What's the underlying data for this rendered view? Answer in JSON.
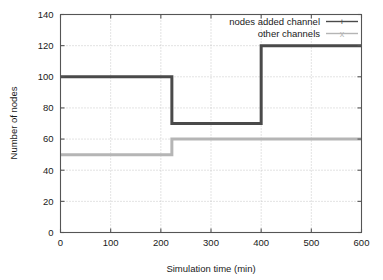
{
  "chart_data": {
    "type": "line",
    "subtype": "step",
    "title": "",
    "xlabel": "Simulation time (min)",
    "ylabel": "Number of nodes",
    "xlim": [
      0,
      600
    ],
    "ylim": [
      0,
      140
    ],
    "xticks": [
      0,
      100,
      200,
      300,
      400,
      500,
      600
    ],
    "yticks": [
      0,
      20,
      40,
      60,
      80,
      100,
      120,
      140
    ],
    "xtick_labels": [
      "0",
      "100",
      "200",
      "300",
      "400",
      "500",
      "600"
    ],
    "ytick_labels": [
      "0",
      "20",
      "40",
      "60",
      "80",
      "100",
      "120",
      "140"
    ],
    "grid": true,
    "grid_style": "dotted",
    "legend_position": "top-right-inside",
    "series": [
      {
        "name": "nodes added channel",
        "color": "#4a4a4a",
        "linewidth": 3,
        "points": [
          [
            0,
            100
          ],
          [
            205,
            100
          ],
          [
            205,
            100
          ],
          [
            222,
            100
          ],
          [
            222,
            70
          ],
          [
            400,
            70
          ],
          [
            400,
            120
          ],
          [
            600,
            120
          ]
        ],
        "step_segments": [
          {
            "x_start": 205,
            "x_end": 222,
            "y": 100
          },
          {
            "x_start": 222,
            "x_end": 400,
            "y": 70
          },
          {
            "x_start": 400,
            "x_end": 600,
            "y": 120
          }
        ]
      },
      {
        "name": "other channels",
        "color": "#b5b5b5",
        "linewidth": 3,
        "points": [
          [
            0,
            50
          ],
          [
            222,
            50
          ],
          [
            222,
            60
          ],
          [
            600,
            60
          ]
        ],
        "step_segments": [
          {
            "x_start": 0,
            "x_end": 222,
            "y": 50
          },
          {
            "x_start": 222,
            "x_end": 600,
            "y": 60
          }
        ]
      }
    ],
    "legend": [
      {
        "label": "nodes added channel",
        "color": "#4a4a4a",
        "marker": "+"
      },
      {
        "label": "other channels",
        "color": "#b5b5b5",
        "marker": "x"
      }
    ]
  },
  "colors": {
    "background": "#ffffff",
    "frame": "#555555",
    "grid": "#b9b9b9",
    "series_dark": "#4a4a4a",
    "series_light": "#b5b5b5",
    "text": "#1a1a1a"
  }
}
